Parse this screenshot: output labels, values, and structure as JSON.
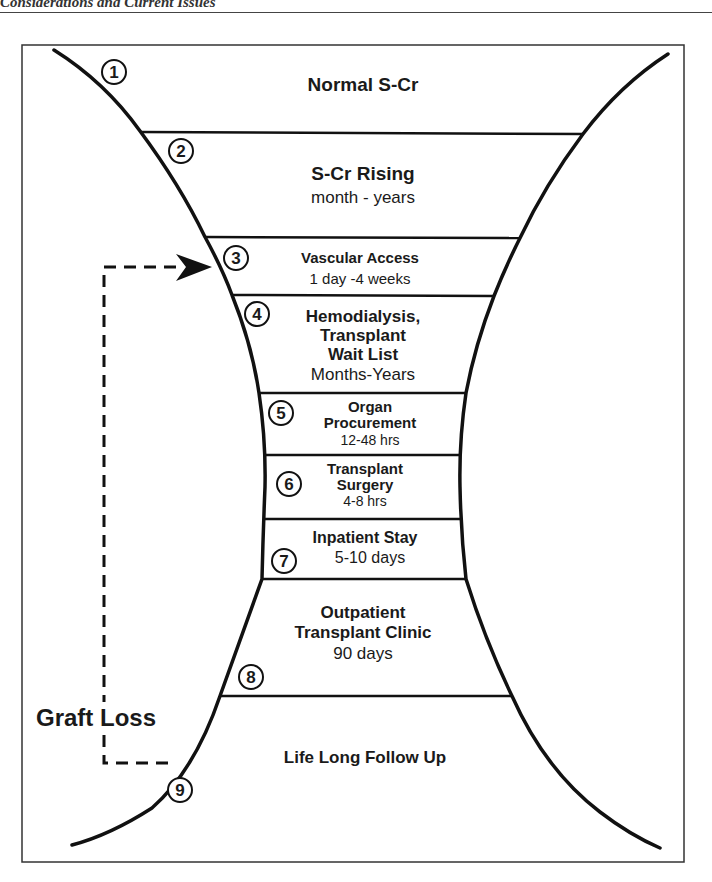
{
  "header": {
    "running_head": "Considerations and Current Issues"
  },
  "diagram": {
    "type": "hourglass-flow",
    "stages": [
      {
        "number": "1",
        "title": "Normal S-Cr",
        "duration": ""
      },
      {
        "number": "2",
        "title": "S-Cr Rising",
        "duration": "month - years"
      },
      {
        "number": "3",
        "title": "Vascular Access",
        "duration": "1 day -4 weeks"
      },
      {
        "number": "4",
        "title_lines": [
          "Hemodialysis,",
          "Transplant",
          "Wait List"
        ],
        "duration": "Months-Years"
      },
      {
        "number": "5",
        "title_lines": [
          "Organ",
          "Procurement"
        ],
        "duration": "12-48 hrs"
      },
      {
        "number": "6",
        "title_lines": [
          "Transplant",
          "Surgery"
        ],
        "duration": "4-8 hrs"
      },
      {
        "number": "7",
        "title": "Inpatient Stay",
        "duration": "5-10 days"
      },
      {
        "number": "8",
        "title_lines": [
          "Outpatient",
          "Transplant Clinic"
        ],
        "duration": "90 days"
      },
      {
        "number": "9",
        "title": "Life Long Follow Up",
        "duration": ""
      }
    ],
    "feedback_loop": {
      "label": "Graft Loss",
      "from_stage": "9",
      "to_stage": "3"
    }
  }
}
